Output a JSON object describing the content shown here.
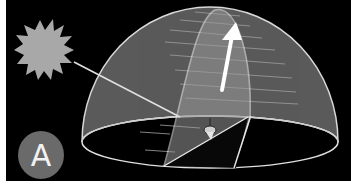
{
  "figure": {
    "label": "A",
    "colors": {
      "background": "#000000",
      "dome_fill": "#5c5c5c",
      "slice_fill": "#8a8a8a",
      "sun": "#a8a8a8",
      "lines": "#e8e8e8",
      "badge": "#6a6a6a"
    }
  }
}
